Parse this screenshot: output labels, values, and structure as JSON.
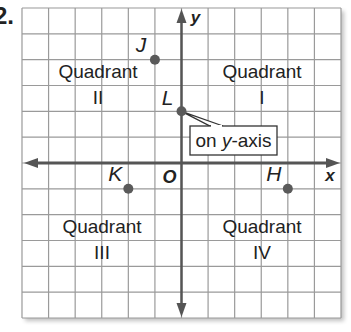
{
  "problem_number": "2.",
  "grid": {
    "cols": 12,
    "rows": 12,
    "x_min": -6,
    "x_max": 6,
    "y_min": -6,
    "y_max": 6,
    "line_color": "#9a9a9a",
    "axis_color": "#555555",
    "point_color": "#5a5a5a"
  },
  "axes": {
    "x_label": "x",
    "y_label": "y",
    "origin_label": "O"
  },
  "quadrants": [
    {
      "word": "Quadrant",
      "numeral": "I"
    },
    {
      "word": "Quadrant",
      "numeral": "II"
    },
    {
      "word": "Quadrant",
      "numeral": "III"
    },
    {
      "word": "Quadrant",
      "numeral": "IV"
    }
  ],
  "points": [
    {
      "label": "J",
      "x": -1,
      "y": 4
    },
    {
      "label": "L",
      "x": 0,
      "y": 2
    },
    {
      "label": "K",
      "x": -2,
      "y": -1
    },
    {
      "label": "H",
      "x": 4,
      "y": -1
    }
  ],
  "callout": {
    "prefix": "on ",
    "italic": "y",
    "suffix": "-axis",
    "target_point": "L"
  },
  "chart_data": {
    "type": "scatter",
    "title": "",
    "xlabel": "x",
    "ylabel": "y",
    "xlim": [
      -6,
      6
    ],
    "ylim": [
      -6,
      6
    ],
    "grid": true,
    "points": [
      {
        "label": "J",
        "x": -1,
        "y": 4
      },
      {
        "label": "L",
        "x": 0,
        "y": 2
      },
      {
        "label": "K",
        "x": -2,
        "y": -1
      },
      {
        "label": "H",
        "x": 4,
        "y": -1
      }
    ],
    "annotations": [
      "Quadrant I",
      "Quadrant II",
      "Quadrant III",
      "Quadrant IV",
      "on y-axis",
      "O"
    ]
  }
}
